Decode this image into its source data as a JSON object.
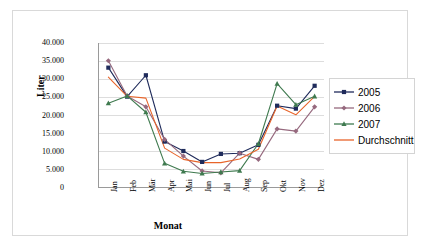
{
  "chart_data": {
    "type": "line",
    "title": "",
    "xlabel": "Monat",
    "ylabel": "Liter",
    "categories": [
      "Jan",
      "Feb",
      "Mär",
      "Apr",
      "Mai",
      "Jun",
      "Jul",
      "Aug",
      "Sep",
      "Okt",
      "Nov",
      "Dez"
    ],
    "ylim": [
      0,
      40000
    ],
    "ytick_labels": [
      "40.000",
      "35.000",
      "30.000",
      "25.000",
      "20.000",
      "15.000",
      "10.000",
      "5.000",
      "0"
    ],
    "ytick_values": [
      40000,
      35000,
      30000,
      25000,
      20000,
      15000,
      10000,
      5000,
      0
    ],
    "grid": "horizontal",
    "legend_position": "right",
    "series": [
      {
        "name": "2005",
        "color": "#1f2b5b",
        "marker": "square",
        "values": [
          33200,
          25200,
          31100,
          12800,
          10200,
          7200,
          9400,
          9600,
          11900,
          22700,
          21900,
          28200
        ]
      },
      {
        "name": "2006",
        "color": "#96697e",
        "marker": "diamond",
        "values": [
          35100,
          25400,
          22400,
          13400,
          8800,
          4700,
          4200,
          9600,
          7900,
          16300,
          15700,
          22400
        ]
      },
      {
        "name": "2007",
        "color": "#3f7a4f",
        "marker": "triangle",
        "values": [
          23400,
          25400,
          20900,
          6800,
          4600,
          4000,
          4400,
          4800,
          12200,
          28800,
          23000,
          25300
        ]
      },
      {
        "name": "Durchschnitt",
        "color": "#e8642a",
        "marker": "none",
        "values": [
          30600,
          25300,
          24800,
          11000,
          7900,
          7000,
          7000,
          8000,
          10700,
          22600,
          20200,
          25300
        ]
      }
    ]
  }
}
